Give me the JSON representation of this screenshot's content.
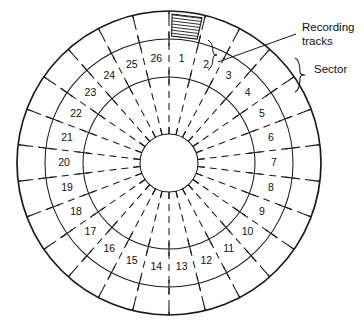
{
  "figure": {
    "type": "diagram",
    "background_color": "#ffffff",
    "ink_color": "#1a1a1a"
  },
  "geometry": {
    "center_x": 169,
    "center_y": 163,
    "hub_radius": 29,
    "circle_radii": [
      29,
      86,
      124,
      152
    ],
    "sector_count": 26,
    "number_ring_radius": 105,
    "start_angle_deg": -90,
    "sector_span_deg": 13.846
  },
  "sectors": [
    {
      "index": 1,
      "label": "1"
    },
    {
      "index": 2,
      "label": "2"
    },
    {
      "index": 3,
      "label": "3"
    },
    {
      "index": 4,
      "label": "4"
    },
    {
      "index": 5,
      "label": "5"
    },
    {
      "index": 6,
      "label": "6"
    },
    {
      "index": 7,
      "label": "7"
    },
    {
      "index": 8,
      "label": "8"
    },
    {
      "index": 9,
      "label": "9"
    },
    {
      "index": 10,
      "label": "10"
    },
    {
      "index": 11,
      "label": "11"
    },
    {
      "index": 12,
      "label": "12"
    },
    {
      "index": 13,
      "label": "13"
    },
    {
      "index": 14,
      "label": "14"
    },
    {
      "index": 15,
      "label": "15"
    },
    {
      "index": 16,
      "label": "16"
    },
    {
      "index": 17,
      "label": "17"
    },
    {
      "index": 18,
      "label": "18"
    },
    {
      "index": 19,
      "label": "19"
    },
    {
      "index": 20,
      "label": "20"
    },
    {
      "index": 21,
      "label": "21"
    },
    {
      "index": 22,
      "label": "22"
    },
    {
      "index": 23,
      "label": "23"
    },
    {
      "index": 24,
      "label": "24"
    },
    {
      "index": 25,
      "label": "25"
    },
    {
      "index": 26,
      "label": "26"
    }
  ],
  "annotations": {
    "recording_tracks": {
      "line1": "Recording",
      "line2": "tracks",
      "text_x": 302,
      "text_y": 31,
      "leader_from_x": 296,
      "leader_from_y": 34,
      "leader_to_x": 218,
      "leader_to_y": 62
    },
    "sector": {
      "label": "Sector",
      "text_x": 314,
      "text_y": 73,
      "brace_x": 300,
      "brace_y_top": 58,
      "brace_y_bottom": 92
    },
    "track_brace": {
      "description": "small brace marking recording-track band width near sector 2",
      "x": 212,
      "y_top": 40,
      "y_bottom": 70
    },
    "hatch_patch": {
      "description": "hatched band of recording tracks in outer ring at sector 1",
      "center_angle_deg": -83
    }
  }
}
